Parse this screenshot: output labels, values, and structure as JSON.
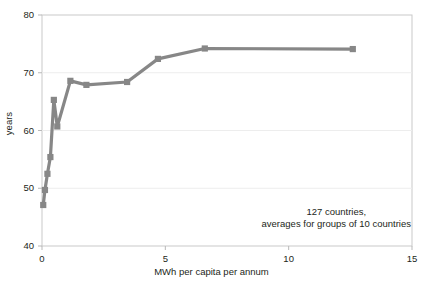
{
  "chart_data": {
    "type": "line",
    "title": "",
    "xlabel": "MWh per capita per annum",
    "ylabel": "years",
    "xlim": [
      0,
      15
    ],
    "ylim": [
      40,
      80
    ],
    "xticks": [
      0,
      5,
      10,
      15
    ],
    "yticks": [
      40,
      50,
      60,
      70,
      80
    ],
    "xtick_labels": [
      "0",
      "5",
      "10",
      "15"
    ],
    "ytick_labels": [
      "40",
      "50",
      "60",
      "70",
      "80"
    ],
    "grid": "faint horizontal gridline at y=50",
    "legend": "none",
    "marker": "square",
    "series_color": "#878787",
    "series": [
      {
        "name": "life expectancy vs electricity use",
        "x": [
          0.05,
          0.12,
          0.22,
          0.34,
          0.48,
          0.62,
          1.15,
          1.8,
          3.45,
          4.7,
          6.6,
          12.6
        ],
        "values": [
          47.1,
          49.7,
          52.5,
          55.4,
          65.3,
          60.7,
          68.6,
          67.9,
          68.4,
          72.4,
          74.2,
          74.1
        ]
      }
    ],
    "annotation": {
      "line1": "127 countries,",
      "line2": "averages for groups of 10 countries"
    }
  },
  "colors": {
    "series": "#878787",
    "axis": "#b9b9b9",
    "grid": "#ededed",
    "text": "#231f20",
    "background": "#ffffff"
  }
}
